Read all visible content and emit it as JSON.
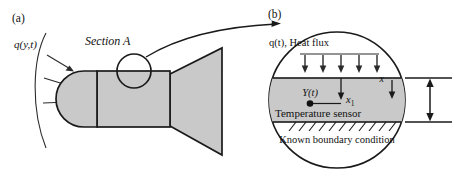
{
  "figure": {
    "panels": [
      {
        "id": "a",
        "label": "(a)",
        "heat_flux_label": "q(y,t)",
        "callout_label": "Section A"
      },
      {
        "id": "b",
        "label": "(b)",
        "heat_flux_label": "q(t), Heat flux",
        "sensor_output_label": "Y(t)",
        "sensor_caption": "Temperature sensor",
        "depth_label": "x",
        "sensor_depth_label": "x",
        "sensor_depth_subscript": "1",
        "boundary_label": "Known boundary condition"
      }
    ],
    "colors": {
      "body_fill": "#c9c9c9",
      "slab_fill": "#c9c9c9",
      "outline": "#1a1a1a",
      "arrow": "#2b2b2b",
      "background": "#ffffff"
    },
    "counts": {
      "panel_a_flux_arrows": 3,
      "panel_b_flux_arrows": 5,
      "boundary_hatch_marks": 11
    }
  }
}
